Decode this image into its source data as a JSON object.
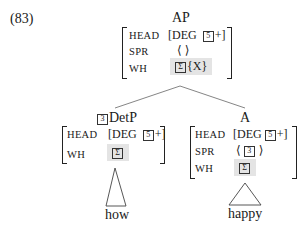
{
  "example_number": "(83)",
  "top_fragment": "",
  "tree": {
    "root": {
      "label": "AP",
      "features": [
        {
          "name": "HEAD",
          "value": "[DEG",
          "tag": "5",
          "tag_suffix": "+]"
        },
        {
          "name": "SPR",
          "value": "⟨ ⟩"
        },
        {
          "name": "WH",
          "tag": "Σ",
          "value": "{X}",
          "shaded": true
        }
      ]
    },
    "left_child": {
      "tag": "3",
      "label": "DetP",
      "features": [
        {
          "name": "HEAD",
          "value": "[DEG",
          "tag": "5",
          "tag_suffix": "+]"
        },
        {
          "name": "WH",
          "tag": "Σ",
          "shaded": true
        }
      ],
      "leaf": "how"
    },
    "right_child": {
      "label": "A",
      "features": [
        {
          "name": "HEAD",
          "value": "[DEG",
          "tag": "5",
          "tag_suffix": "+]"
        },
        {
          "name": "SPR",
          "value_open": "⟨",
          "tag": "3",
          "value_close": "⟩"
        },
        {
          "name": "WH",
          "tag": "Σ",
          "shaded": true
        }
      ],
      "leaf": "happy"
    }
  }
}
